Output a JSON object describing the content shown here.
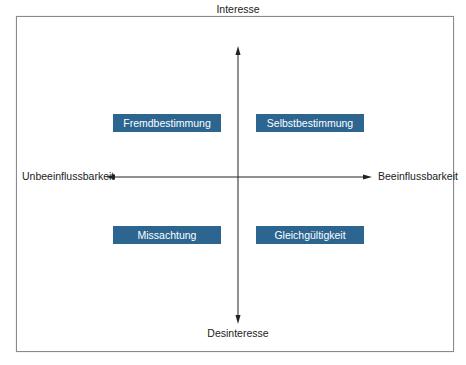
{
  "diagram": {
    "axes": {
      "top": "Interesse",
      "bottom": "Desinteresse",
      "left": "Unbeeinflussbarkeit",
      "right": "Beeinflussbarkeit"
    },
    "quadrants": [
      {
        "position": "top-left",
        "label": "Fremdbestimmung"
      },
      {
        "position": "top-right",
        "label": "Selbstbestimmung"
      },
      {
        "position": "bottom-left",
        "label": "Missachtung"
      },
      {
        "position": "bottom-right",
        "label": "Gleichgültigkeit"
      }
    ],
    "colors": {
      "box_fill": "#2b6590",
      "box_text": "#ffffff",
      "axis_line": "#222222",
      "frame_border": "#8a8a8a"
    }
  }
}
